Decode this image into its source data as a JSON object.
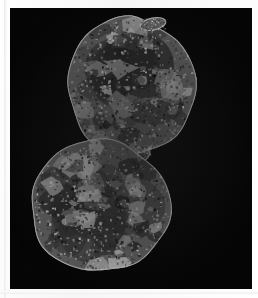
{
  "figure": {
    "medium": "grayscale micrograph",
    "background_color": "#050505",
    "mount_color": "#ffffff",
    "plate": {
      "x": 10,
      "y": 8,
      "width": 242,
      "height": 281
    },
    "alt_text": "Grayscale micrograph of a bilobed specimen on a black field"
  },
  "specimen": {
    "name": "bilobed-tissue-section",
    "description": "Two rounded lobes joined by a narrow connective stalk, mottled granular texture",
    "lobe_count": 2,
    "tone_range": {
      "darkest": "#0b0b0b",
      "midtone": "#5a5a5a",
      "brightest": "#cfcfcf"
    },
    "lobes": [
      {
        "id": "upper-lobe",
        "label": "upper lobe",
        "center_x": 131,
        "center_y": 86,
        "radius_x": 64,
        "radius_y": 69,
        "rotation_deg": -8,
        "features": "bright irregular patches upper-centre, dark core, pale rim"
      },
      {
        "id": "lower-lobe",
        "label": "lower lobe",
        "center_x": 100,
        "center_y": 206,
        "radius_x": 70,
        "radius_y": 66,
        "rotation_deg": 4,
        "features": "broad pale reticular patches right of centre, dark mottling left"
      }
    ],
    "connector": {
      "id": "isthmus",
      "label": "connective stalk",
      "x": 128,
      "y": 152,
      "width": 44,
      "height": 26
    },
    "protrusion": {
      "id": "apical-bump",
      "label": "apical protrusion",
      "x": 140,
      "y": 18,
      "width": 26,
      "height": 12
    }
  },
  "texture": {
    "granule_count": 1500,
    "patch_count": 120,
    "grain_opacity": 0.55,
    "rim_highlight_color": "#d2d2d2"
  }
}
